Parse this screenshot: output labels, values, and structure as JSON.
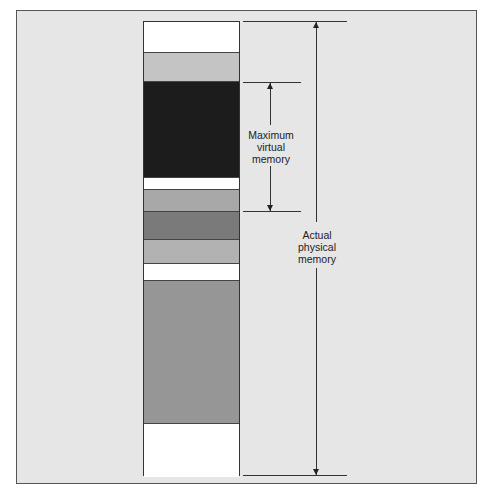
{
  "diagram": {
    "column": {
      "bands": [
        {
          "name": "free-region-1",
          "top": 0,
          "height": 31,
          "color": "#ffffff"
        },
        {
          "name": "light-gray-region-1",
          "top": 31,
          "height": 29,
          "color": "#c4c4c4"
        },
        {
          "name": "virtual-memory-region",
          "top": 60,
          "height": 96,
          "color": "#1c1c1c"
        },
        {
          "name": "free-region-2",
          "top": 156,
          "height": 12,
          "color": "#ffffff"
        },
        {
          "name": "light-gray-region-2",
          "top": 168,
          "height": 22,
          "color": "#a8a8a8"
        },
        {
          "name": "dark-gray-region",
          "top": 190,
          "height": 28,
          "color": "#7a7a7a"
        },
        {
          "name": "light-gray-region-3",
          "top": 218,
          "height": 24,
          "color": "#b2b2b2"
        },
        {
          "name": "free-region-3",
          "top": 242,
          "height": 17,
          "color": "#ffffff"
        },
        {
          "name": "medium-gray-region",
          "top": 259,
          "height": 143,
          "color": "#969696"
        },
        {
          "name": "free-region-4",
          "top": 402,
          "height": 53,
          "color": "#ffffff"
        }
      ]
    },
    "labels": {
      "virtual": [
        "Maximum",
        "virtual",
        "memory"
      ],
      "physical": [
        "Actual",
        "physical",
        "memory"
      ]
    },
    "colors": {
      "background": "#e6e6e6",
      "line": "#333333"
    }
  }
}
